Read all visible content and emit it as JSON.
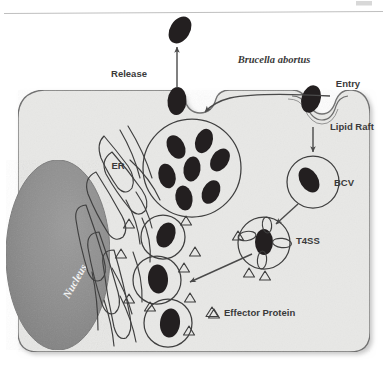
{
  "figure": {
    "organism_label": "Brucella abortus",
    "labels": {
      "release": "Release",
      "entry": "Entry",
      "lipid_raft": "Lipid Raft",
      "bcv": "BCV",
      "t4ss": "T4SS",
      "er": "ER",
      "nucleus": "Nucleus"
    },
    "legend": {
      "symbol": "triangle-outline",
      "text": "Effector Protein"
    },
    "colors": {
      "bacterium": "#231f20",
      "cytoplasm": "#e8e8e6",
      "cell_outline": "#6d6d6d",
      "nucleus": "#8d8d8d",
      "nucleus_edge": "#7a7a7a",
      "organelle_outline": "#4a4a4a",
      "arrow": "#4a4a4a",
      "text": "#3a3a3a",
      "page_background": "#ffffff",
      "top_rule": "#b8b8b8"
    },
    "counts": {
      "bacteria_in_replication_vacuole": 6,
      "bacteria_outside_cell": 1,
      "bacteria_at_release_pore": 1,
      "bacteria_at_entry_pore": 1,
      "single_bacterium_vacuoles": 4,
      "effector_triangles": 13
    },
    "structures": [
      "host-cell-membrane",
      "nucleus",
      "endoplasmic-reticulum",
      "replication-vacuole",
      "bcv",
      "t4ss-vacuole",
      "effector-proteins"
    ],
    "replication_vacuole_bacteria": [
      {
        "cx": 176,
        "cy": 147,
        "rx": 8.5,
        "ry": 12.5,
        "rot": -28
      },
      {
        "cx": 203,
        "cy": 142,
        "rx": 8.5,
        "ry": 12.5,
        "rot": 22
      },
      {
        "cx": 168,
        "cy": 175,
        "rx": 8.5,
        "ry": 12.5,
        "rot": -18
      },
      {
        "cx": 191,
        "cy": 168,
        "rx": 8.5,
        "ry": 12.5,
        "rot": 8
      },
      {
        "cx": 218,
        "cy": 158,
        "rx": 8.5,
        "ry": 12.5,
        "rot": 34
      },
      {
        "cx": 184,
        "cy": 196,
        "rx": 8.5,
        "ry": 12.5,
        "rot": -12
      },
      {
        "cx": 210,
        "cy": 190,
        "rx": 8.5,
        "ry": 12.5,
        "rot": 26
      }
    ],
    "chain_vacuoles": [
      {
        "cx": 161,
        "cy": 236,
        "r": 21
      },
      {
        "cx": 156,
        "cy": 278,
        "r": 23
      },
      {
        "cx": 166,
        "cy": 322,
        "r": 23
      }
    ],
    "effector_triangles": [
      {
        "x": 129,
        "y": 224
      },
      {
        "x": 186,
        "y": 221
      },
      {
        "x": 193,
        "y": 252
      },
      {
        "x": 121,
        "y": 254
      },
      {
        "x": 186,
        "y": 268
      },
      {
        "x": 238,
        "y": 236
      },
      {
        "x": 247,
        "y": 272
      },
      {
        "x": 207,
        "y": 243
      },
      {
        "x": 129,
        "y": 299
      },
      {
        "x": 189,
        "y": 298
      },
      {
        "x": 148,
        "y": 307
      },
      {
        "x": 188,
        "y": 330
      },
      {
        "x": 214,
        "y": 313
      }
    ]
  }
}
